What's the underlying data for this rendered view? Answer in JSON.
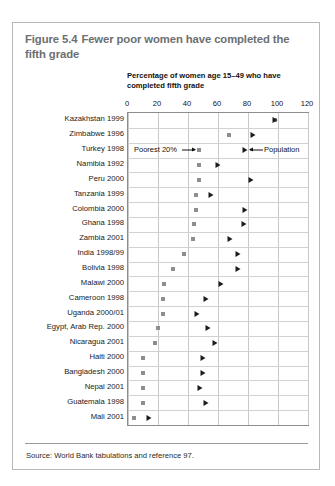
{
  "figure": {
    "number": "Figure 5.4",
    "title": "Fewer poor women have completed the fifth grade",
    "source_note": "Source: World Bank tabulations and reference 97."
  },
  "chart_data": {
    "type": "scatter",
    "subtitle": "Percentage of women age 15–49 who have completed fifth grade",
    "xlabel": "Percentage of women age 15–49 who have completed fifth grade",
    "ylabel": "",
    "orientation": "horizontal",
    "xlim": [
      0,
      120
    ],
    "xticks": [
      0,
      20,
      40,
      60,
      80,
      100,
      120
    ],
    "xtick_labels": [
      "0",
      "20",
      "40",
      "60",
      "80",
      "100",
      "120"
    ],
    "grid": "vertical-and-horizontal",
    "legend_position": "inside-plot-row-3",
    "marker_legend": [
      {
        "name": "Poorest 20%",
        "glyph": "square",
        "color": "#8e8e90"
      },
      {
        "name": "Population",
        "glyph": "triangle",
        "color": "#1c1c1c"
      }
    ],
    "categories": [
      "Kazakhstan 1999",
      "Zimbabwe 1996",
      "Turkey 1998",
      "Namibia 1992",
      "Peru 2000",
      "Tanzania 1999",
      "Colombia 2000",
      "Ghana 1998",
      "Zambia 2001",
      "India 1998/99",
      "Bolivia 1998",
      "Malawi 2000",
      "Cameroon 1998",
      "Uganda 2000/01",
      "Egypt, Arab Rep. 2000",
      "Nicaragua 2001",
      "Haiti 2000",
      "Bangladesh 2000",
      "Nepal 2001",
      "Guatemala 1998",
      "Mali 2001"
    ],
    "series": [
      {
        "name": "Poorest 20%",
        "glyph": "square",
        "values": [
          98,
          67,
          47,
          47,
          47,
          45,
          45,
          44,
          43,
          37,
          30,
          24,
          23,
          23,
          20,
          18,
          10,
          10,
          10,
          10,
          4
        ]
      },
      {
        "name": "Population",
        "glyph": "triangle",
        "values": [
          98,
          83,
          78,
          60,
          82,
          55,
          78,
          77,
          68,
          73,
          73,
          62,
          52,
          46,
          53,
          58,
          50,
          50,
          48,
          52,
          14
        ]
      }
    ],
    "annotations": [
      {
        "text": "Poorest 20%",
        "points_to": "square marker on Turkey 1998 row",
        "arrow": "right"
      },
      {
        "text": "Population",
        "points_to": "triangle marker on Turkey 1998 row",
        "arrow": "left"
      }
    ]
  }
}
